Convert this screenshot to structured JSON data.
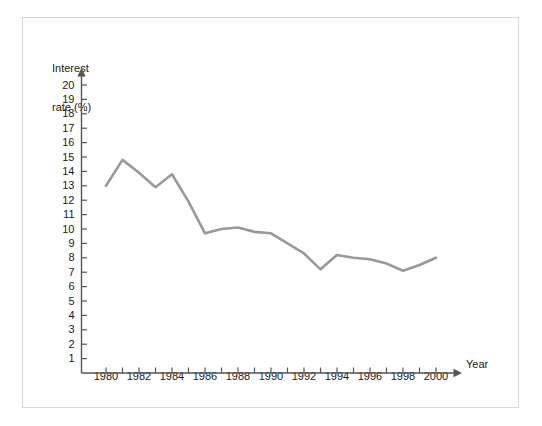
{
  "chart_data": {
    "type": "line",
    "title": "",
    "subtitle": "",
    "xlabel": "Year",
    "ylabel": "Interest\nrate (%)",
    "ylabel_line1": "Interest",
    "ylabel_line2": "rate (%)",
    "x": [
      1980,
      1981,
      1982,
      1983,
      1984,
      1985,
      1986,
      1987,
      1988,
      1989,
      1990,
      1991,
      1992,
      1993,
      1994,
      1995,
      1996,
      1997,
      1998,
      1999,
      2000
    ],
    "values": [
      13.0,
      14.8,
      13.9,
      12.9,
      13.8,
      11.9,
      9.7,
      10.0,
      10.1,
      9.8,
      9.7,
      9.0,
      8.3,
      7.2,
      8.2,
      8.0,
      7.9,
      7.6,
      7.1,
      7.5,
      8.0
    ],
    "series": [
      {
        "name": "Interest rate",
        "values": [
          13.0,
          14.8,
          13.9,
          12.9,
          13.8,
          11.9,
          9.7,
          10.0,
          10.1,
          9.8,
          9.7,
          9.0,
          8.3,
          7.2,
          8.2,
          8.0,
          7.9,
          7.6,
          7.1,
          7.5,
          8.0
        ]
      }
    ],
    "ylim": [
      0,
      21
    ],
    "xlim": [
      1979,
      2001.5
    ],
    "ytick_labels": [
      "20",
      "19",
      "18",
      "17",
      "16",
      "15",
      "14",
      "13",
      "12",
      "11",
      "10",
      "9",
      "8",
      "7",
      "6",
      "5",
      "4",
      "3",
      "2",
      "1"
    ],
    "ytick_values": [
      20,
      19,
      18,
      17,
      16,
      15,
      14,
      13,
      12,
      11,
      10,
      9,
      8,
      7,
      6,
      5,
      4,
      3,
      2,
      1
    ],
    "xtick_values": [
      1980,
      1981,
      1982,
      1983,
      1984,
      1985,
      1986,
      1987,
      1988,
      1989,
      1990,
      1991,
      1992,
      1993,
      1994,
      1995,
      1996,
      1997,
      1998,
      1999,
      2000
    ],
    "xtick_labels_shown": [
      "1980",
      "1982",
      "1984",
      "1986",
      "1988",
      "1990",
      "1992",
      "1994",
      "1996",
      "1998",
      "2000"
    ],
    "xtick_label_values": [
      1980,
      1982,
      1984,
      1986,
      1988,
      1990,
      1992,
      1994,
      1996,
      1998,
      2000
    ],
    "grid": false,
    "legend": false,
    "legend_position": "none",
    "line_color": "#999999",
    "axis_color": "#555555",
    "text_color": "#1a1a1a",
    "frame_color": "#d8d8d8",
    "background_color": "#ffffff"
  }
}
